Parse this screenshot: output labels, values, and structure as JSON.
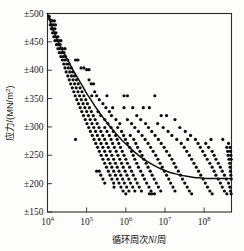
{
  "chart_data": {
    "type": "scatter",
    "title": "",
    "xlabel": "循环周次N/周",
    "ylabel": "应力/(MN/m²)",
    "xlabel_parts": {
      "prefix": "循环周次",
      "italic": "N",
      "suffix": "/周"
    },
    "ylabel_parts": {
      "prefix": "应力/(MN/m",
      "superscript": "2",
      "suffix": ")"
    },
    "xscale": "log",
    "yscale": "linear",
    "xlim": [
      10000,
      500000000
    ],
    "ylim": [
      150,
      500
    ],
    "grid": false,
    "legend": null,
    "x_tick_values": [
      10000,
      100000,
      1000000,
      10000000,
      100000000
    ],
    "x_tick_labels": [
      "10⁴",
      "10⁵",
      "10⁶",
      "10⁷",
      "10⁸"
    ],
    "x_tick_mantissa": [
      "10",
      "10",
      "10",
      "10",
      "10"
    ],
    "x_tick_exponents": [
      "4",
      "5",
      "6",
      "7",
      "8"
    ],
    "y_tick_values": [
      150,
      200,
      250,
      300,
      350,
      400,
      450,
      500
    ],
    "y_tick_labels": [
      "±150",
      "±200",
      "±250",
      "±300",
      "±350",
      "±400",
      "±450",
      "±500"
    ],
    "marker": "filled-circle",
    "marker_color": "#0d0d0d",
    "marker_size_px": 2.5,
    "curve_color": "#111111",
    "curve_label": "S-N fit curve",
    "fit_curve": [
      [
        10000,
        500
      ],
      [
        12000,
        483
      ],
      [
        14500,
        468
      ],
      [
        17500,
        455
      ],
      [
        21000,
        443
      ],
      [
        25500,
        432
      ],
      [
        31000,
        421
      ],
      [
        38000,
        410
      ],
      [
        46000,
        399
      ],
      [
        56000,
        389
      ],
      [
        68000,
        379
      ],
      [
        83000,
        369
      ],
      [
        100000,
        359
      ],
      [
        125000,
        349
      ],
      [
        155000,
        339
      ],
      [
        195000,
        329
      ],
      [
        245000,
        319
      ],
      [
        310000,
        310
      ],
      [
        400000,
        300
      ],
      [
        520000,
        291
      ],
      [
        680000,
        282
      ],
      [
        900000,
        273
      ],
      [
        1200000,
        265
      ],
      [
        1600000,
        257
      ],
      [
        2200000,
        249
      ],
      [
        3000000,
        242
      ],
      [
        4200000,
        236
      ],
      [
        6000000,
        230
      ],
      [
        8500000,
        225
      ],
      [
        12000000,
        221
      ],
      [
        17000000,
        218
      ],
      [
        25000000,
        215
      ],
      [
        36000000,
        213
      ],
      [
        55000000,
        211
      ],
      [
        85000000,
        210
      ],
      [
        130000000,
        209
      ],
      [
        200000000,
        209
      ],
      [
        300000000,
        209
      ],
      [
        500000000,
        209
      ]
    ],
    "points": [
      [
        11000,
        495
      ],
      [
        11500,
        490
      ],
      [
        12500,
        487
      ],
      [
        13500,
        487
      ],
      [
        15000,
        487
      ],
      [
        11800,
        480
      ],
      [
        13000,
        480
      ],
      [
        14500,
        480
      ],
      [
        16000,
        480
      ],
      [
        12500,
        473
      ],
      [
        14000,
        473
      ],
      [
        15500,
        473
      ],
      [
        13500,
        466
      ],
      [
        15000,
        466
      ],
      [
        16500,
        466
      ],
      [
        14500,
        459
      ],
      [
        16000,
        459
      ],
      [
        18500,
        459
      ],
      [
        15500,
        452
      ],
      [
        17500,
        452
      ],
      [
        19500,
        452
      ],
      [
        22000,
        452
      ],
      [
        17000,
        445
      ],
      [
        19000,
        445
      ],
      [
        21000,
        445
      ],
      [
        18500,
        438
      ],
      [
        21000,
        438
      ],
      [
        24000,
        438
      ],
      [
        28000,
        438
      ],
      [
        20000,
        431
      ],
      [
        23000,
        431
      ],
      [
        26500,
        431
      ],
      [
        22000,
        424
      ],
      [
        25500,
        424
      ],
      [
        29000,
        424
      ],
      [
        24000,
        418
      ],
      [
        28000,
        418
      ],
      [
        33000,
        418
      ],
      [
        52000,
        418
      ],
      [
        60000,
        418
      ],
      [
        26000,
        411
      ],
      [
        31000,
        411
      ],
      [
        36000,
        411
      ],
      [
        28000,
        404
      ],
      [
        34000,
        404
      ],
      [
        40000,
        404
      ],
      [
        72000,
        404
      ],
      [
        85000,
        404
      ],
      [
        100000,
        401
      ],
      [
        115000,
        401
      ],
      [
        30000,
        397
      ],
      [
        37000,
        397
      ],
      [
        44000,
        397
      ],
      [
        33000,
        390
      ],
      [
        41000,
        390
      ],
      [
        49000,
        390
      ],
      [
        36000,
        383
      ],
      [
        45000,
        383
      ],
      [
        55000,
        383
      ],
      [
        115000,
        383
      ],
      [
        39000,
        376
      ],
      [
        49000,
        376
      ],
      [
        61000,
        376
      ],
      [
        130000,
        376
      ],
      [
        150000,
        376
      ],
      [
        43000,
        369
      ],
      [
        54000,
        369
      ],
      [
        68000,
        369
      ],
      [
        47000,
        362
      ],
      [
        60000,
        362
      ],
      [
        76000,
        362
      ],
      [
        160000,
        362
      ],
      [
        51000,
        355
      ],
      [
        66000,
        355
      ],
      [
        85000,
        355
      ],
      [
        135000,
        355
      ],
      [
        180000,
        355
      ],
      [
        330000,
        355
      ],
      [
        900000,
        355
      ],
      [
        1100000,
        355
      ],
      [
        5500000,
        355
      ],
      [
        56000,
        348
      ],
      [
        73000,
        348
      ],
      [
        95000,
        348
      ],
      [
        210000,
        348
      ],
      [
        62000,
        341
      ],
      [
        81000,
        341
      ],
      [
        105000,
        341
      ],
      [
        260000,
        341
      ],
      [
        68000,
        334
      ],
      [
        90000,
        334
      ],
      [
        118000,
        334
      ],
      [
        310000,
        334
      ],
      [
        460000,
        334
      ],
      [
        900000,
        334
      ],
      [
        1500000,
        334
      ],
      [
        2800000,
        334
      ],
      [
        4000000,
        334
      ],
      [
        75000,
        327
      ],
      [
        100000,
        327
      ],
      [
        132000,
        327
      ],
      [
        195000,
        327
      ],
      [
        380000,
        327
      ],
      [
        83000,
        320
      ],
      [
        111000,
        320
      ],
      [
        148000,
        320
      ],
      [
        230000,
        320
      ],
      [
        430000,
        320
      ],
      [
        1900000,
        320
      ],
      [
        8000000,
        320
      ],
      [
        11000000,
        320
      ],
      [
        92000,
        313
      ],
      [
        123000,
        313
      ],
      [
        165000,
        313
      ],
      [
        290000,
        313
      ],
      [
        560000,
        313
      ],
      [
        1100000,
        313
      ],
      [
        2400000,
        313
      ],
      [
        18000000,
        313
      ],
      [
        102000,
        306
      ],
      [
        137000,
        306
      ],
      [
        185000,
        306
      ],
      [
        350000,
        306
      ],
      [
        700000,
        306
      ],
      [
        1400000,
        306
      ],
      [
        3200000,
        306
      ],
      [
        6500000,
        306
      ],
      [
        113000,
        299
      ],
      [
        152000,
        299
      ],
      [
        207000,
        299
      ],
      [
        290000,
        299
      ],
      [
        420000,
        299
      ],
      [
        620000,
        299
      ],
      [
        1700000,
        299
      ],
      [
        3800000,
        299
      ],
      [
        9000000,
        299
      ],
      [
        24000000,
        299
      ],
      [
        125000,
        292
      ],
      [
        169000,
        292
      ],
      [
        231000,
        292
      ],
      [
        330000,
        292
      ],
      [
        480000,
        292
      ],
      [
        780000,
        292
      ],
      [
        2100000,
        292
      ],
      [
        4600000,
        292
      ],
      [
        12000000,
        292
      ],
      [
        33000000,
        292
      ],
      [
        139000,
        285
      ],
      [
        188000,
        285
      ],
      [
        258000,
        285
      ],
      [
        380000,
        285
      ],
      [
        550000,
        285
      ],
      [
        880000,
        285
      ],
      [
        1300000,
        285
      ],
      [
        2600000,
        285
      ],
      [
        5600000,
        285
      ],
      [
        15000000,
        285
      ],
      [
        45000000,
        285
      ],
      [
        52000,
        278
      ],
      [
        154000,
        278
      ],
      [
        209000,
        278
      ],
      [
        288000,
        278
      ],
      [
        420000,
        278
      ],
      [
        600000,
        278
      ],
      [
        980000,
        278
      ],
      [
        1600000,
        278
      ],
      [
        3100000,
        278
      ],
      [
        6800000,
        278
      ],
      [
        20000000,
        278
      ],
      [
        38000000,
        278
      ],
      [
        60000000,
        278
      ],
      [
        150000000,
        278
      ],
      [
        300000000,
        278
      ],
      [
        171000,
        271
      ],
      [
        233000,
        271
      ],
      [
        321000,
        271
      ],
      [
        460000,
        271
      ],
      [
        660000,
        271
      ],
      [
        1100000,
        271
      ],
      [
        1800000,
        271
      ],
      [
        3700000,
        271
      ],
      [
        8000000,
        271
      ],
      [
        26000000,
        271
      ],
      [
        70000000,
        271
      ],
      [
        110000000,
        271
      ],
      [
        420000000,
        271
      ],
      [
        190000,
        264
      ],
      [
        259000,
        264
      ],
      [
        357000,
        264
      ],
      [
        510000,
        264
      ],
      [
        730000,
        264
      ],
      [
        1250000,
        264
      ],
      [
        2000000,
        264
      ],
      [
        4300000,
        264
      ],
      [
        9500000,
        264
      ],
      [
        31000000,
        264
      ],
      [
        80000000,
        264
      ],
      [
        130000000,
        264
      ],
      [
        380000000,
        264
      ],
      [
        460000000,
        264
      ],
      [
        211000,
        257
      ],
      [
        288000,
        257
      ],
      [
        397000,
        257
      ],
      [
        570000,
        257
      ],
      [
        810000,
        257
      ],
      [
        1400000,
        257
      ],
      [
        2300000,
        257
      ],
      [
        5000000,
        257
      ],
      [
        11000000,
        257
      ],
      [
        36000000,
        257
      ],
      [
        92000000,
        257
      ],
      [
        160000000,
        257
      ],
      [
        400000000,
        257
      ],
      [
        470000000,
        257
      ],
      [
        234000,
        250
      ],
      [
        320000,
        250
      ],
      [
        441000,
        250
      ],
      [
        630000,
        250
      ],
      [
        900000,
        250
      ],
      [
        1550000,
        250
      ],
      [
        2600000,
        250
      ],
      [
        5800000,
        250
      ],
      [
        13000000,
        250
      ],
      [
        42000000,
        250
      ],
      [
        105000000,
        250
      ],
      [
        180000000,
        250
      ],
      [
        410000000,
        250
      ],
      [
        480000000,
        250
      ],
      [
        260000,
        243
      ],
      [
        356000,
        243
      ],
      [
        490000,
        243
      ],
      [
        700000,
        243
      ],
      [
        1000000,
        243
      ],
      [
        1700000,
        243
      ],
      [
        2900000,
        243
      ],
      [
        6600000,
        243
      ],
      [
        15000000,
        243
      ],
      [
        48000000,
        243
      ],
      [
        120000000,
        243
      ],
      [
        200000000,
        243
      ],
      [
        430000000,
        243
      ],
      [
        490000000,
        243
      ],
      [
        289000,
        236
      ],
      [
        395000,
        236
      ],
      [
        545000,
        236
      ],
      [
        780000,
        236
      ],
      [
        1100000,
        236
      ],
      [
        1900000,
        236
      ],
      [
        3300000,
        236
      ],
      [
        7500000,
        236
      ],
      [
        17000000,
        236
      ],
      [
        55000000,
        236
      ],
      [
        140000000,
        236
      ],
      [
        230000000,
        236
      ],
      [
        450000000,
        236
      ],
      [
        321000,
        229
      ],
      [
        439000,
        229
      ],
      [
        605000,
        229
      ],
      [
        860000,
        229
      ],
      [
        1250000,
        229
      ],
      [
        2100000,
        229
      ],
      [
        3700000,
        229
      ],
      [
        8500000,
        229
      ],
      [
        19000000,
        229
      ],
      [
        63000000,
        229
      ],
      [
        160000000,
        229
      ],
      [
        260000000,
        229
      ],
      [
        460000000,
        229
      ],
      [
        180000,
        222
      ],
      [
        210000,
        222
      ],
      [
        357000,
        222
      ],
      [
        490000,
        222
      ],
      [
        670000,
        222
      ],
      [
        960000,
        222
      ],
      [
        1400000,
        222
      ],
      [
        2400000,
        222
      ],
      [
        4200000,
        222
      ],
      [
        9700000,
        222
      ],
      [
        22000000,
        222
      ],
      [
        72000000,
        222
      ],
      [
        180000000,
        222
      ],
      [
        290000000,
        222
      ],
      [
        470000000,
        222
      ],
      [
        230000,
        215
      ],
      [
        395000,
        215
      ],
      [
        545000,
        215
      ],
      [
        745000,
        215
      ],
      [
        1070000,
        215
      ],
      [
        1550000,
        215
      ],
      [
        2700000,
        215
      ],
      [
        4700000,
        215
      ],
      [
        11000000,
        215
      ],
      [
        25000000,
        215
      ],
      [
        82000000,
        215
      ],
      [
        200000000,
        215
      ],
      [
        330000000,
        215
      ],
      [
        480000000,
        215
      ],
      [
        260000,
        208
      ],
      [
        440000,
        208
      ],
      [
        605000,
        208
      ],
      [
        830000,
        208
      ],
      [
        1190000,
        208
      ],
      [
        1750000,
        208
      ],
      [
        3000000,
        208
      ],
      [
        5300000,
        208
      ],
      [
        12500000,
        208
      ],
      [
        28000000,
        208
      ],
      [
        94000000,
        208
      ],
      [
        230000000,
        208
      ],
      [
        370000000,
        208
      ],
      [
        490000000,
        208
      ],
      [
        290000,
        201
      ],
      [
        490000,
        201
      ],
      [
        670000,
        201
      ],
      [
        920000,
        201
      ],
      [
        1320000,
        201
      ],
      [
        1950000,
        201
      ],
      [
        3400000,
        201
      ],
      [
        6000000,
        201
      ],
      [
        14000000,
        201
      ],
      [
        32000000,
        201
      ],
      [
        107000000,
        201
      ],
      [
        260000000,
        201
      ],
      [
        420000000,
        201
      ],
      [
        500000,
        194
      ],
      [
        750000,
        194
      ],
      [
        1050000,
        194
      ],
      [
        1500000,
        194
      ],
      [
        2200000,
        194
      ],
      [
        3900000,
        194
      ],
      [
        6800000,
        194
      ],
      [
        16000000,
        194
      ],
      [
        37000000,
        194
      ],
      [
        122000000,
        194
      ],
      [
        290000000,
        194
      ],
      [
        450000000,
        194
      ],
      [
        850000,
        187
      ],
      [
        1200000,
        187
      ],
      [
        1700000,
        187
      ],
      [
        2500000,
        187
      ],
      [
        4400000,
        187
      ],
      [
        7800000,
        187
      ],
      [
        18000000,
        187
      ],
      [
        42000000,
        187
      ],
      [
        140000000,
        187
      ],
      [
        330000000,
        187
      ],
      [
        470000000,
        187
      ],
      [
        1000000,
        182
      ],
      [
        4000000,
        182
      ],
      [
        4600000,
        182
      ],
      [
        5400000,
        182
      ],
      [
        48000000,
        182
      ],
      [
        160000000,
        182
      ],
      [
        380000000,
        182
      ],
      [
        490000000,
        182
      ]
    ]
  }
}
